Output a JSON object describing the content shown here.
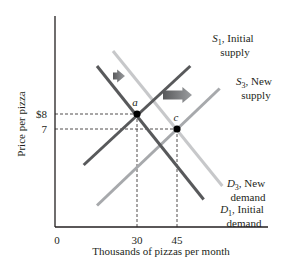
{
  "chart_data": {
    "type": "line",
    "title": "",
    "xlabel": "Thousands of pizzas per month",
    "ylabel": "Price per pizza",
    "xlim": [
      0,
      80
    ],
    "ylim": [
      0,
      15
    ],
    "x_ticks": [
      {
        "value": 0,
        "label": "0"
      },
      {
        "value": 30,
        "label": "30"
      },
      {
        "value": 45,
        "label": "45"
      }
    ],
    "y_ticks": [
      {
        "value": 8,
        "label": "$8"
      },
      {
        "value": 7,
        "label": "7"
      }
    ],
    "grid": false,
    "series": [
      {
        "id": "D1",
        "name": "D1, Initial demand",
        "sym": "D",
        "sub": "1",
        "label_line1": ", Initial",
        "label_line2": "demand",
        "color": "#58595b",
        "points": [
          [
            15,
            11.2
          ],
          [
            55,
            2.3
          ]
        ]
      },
      {
        "id": "D3",
        "name": "D3, New demand",
        "sym": "D",
        "sub": "3",
        "label_line1": ", New",
        "label_line2": "demand",
        "color": "#c7c8ca",
        "points": [
          [
            21,
            12.2
          ],
          [
            62,
            3.2
          ]
        ]
      },
      {
        "id": "S1",
        "name": "S1, Initial supply",
        "sym": "S",
        "sub": "1",
        "label_line1": ", Initial",
        "label_line2": "supply",
        "color": "#58595b",
        "points": [
          [
            10,
            4.6
          ],
          [
            50,
            11.2
          ]
        ]
      },
      {
        "id": "S3",
        "name": "S3, New supply",
        "sym": "S",
        "sub": "3",
        "label_line1": ", New",
        "label_line2": "supply",
        "color": "#a7a9ac",
        "points": [
          [
            15,
            1.9
          ],
          [
            61,
            9.7
          ]
        ]
      }
    ],
    "equilibria": [
      {
        "label": "a",
        "x": 30,
        "y": 8
      },
      {
        "label": "c",
        "x": 45,
        "y": 7
      }
    ],
    "annotations": [
      {
        "type": "arrow",
        "direction": "right",
        "meaning": "demand shift",
        "size": "small"
      },
      {
        "type": "arrow",
        "direction": "right",
        "meaning": "supply shift",
        "size": "large"
      }
    ]
  }
}
